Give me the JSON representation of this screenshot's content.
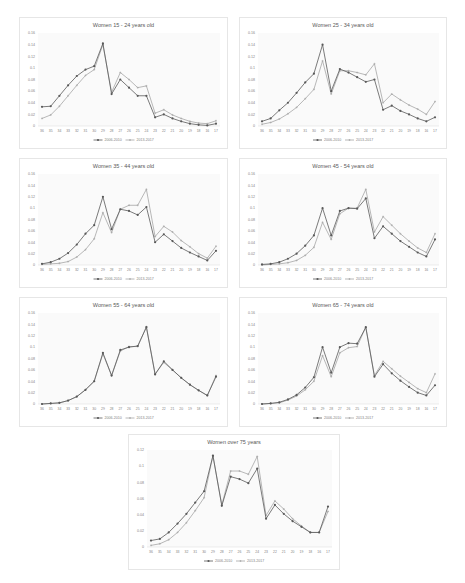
{
  "chart_data": [
    {
      "type": "line",
      "title": "Women 15 - 24 years old",
      "xlabel": "",
      "ylabel": "",
      "ylim": [
        0,
        0.16
      ],
      "yticks": [
        "0",
        "0.02",
        "0.04",
        "0.06",
        "0.08",
        "0.1",
        "0.12",
        "0.14",
        "0.16"
      ],
      "grid": false,
      "legend_position": "bottom",
      "categories": [
        "36",
        "35",
        "34",
        "33",
        "32",
        "31",
        "30",
        "29",
        "28",
        "27",
        "26",
        "25",
        "24",
        "23",
        "22",
        "21",
        "20",
        "19",
        "18",
        "16",
        "17"
      ],
      "series": [
        {
          "name": "2006-2010",
          "values": [
            0.033,
            0.034,
            0.052,
            0.07,
            0.086,
            0.097,
            0.103,
            0.142,
            0.055,
            0.08,
            0.066,
            0.052,
            0.052,
            0.015,
            0.02,
            0.013,
            0.008,
            0.004,
            0.002,
            0.001,
            0.004
          ]
        },
        {
          "name": "2013-2017",
          "values": [
            0.013,
            0.019,
            0.034,
            0.052,
            0.07,
            0.087,
            0.097,
            0.14,
            0.058,
            0.092,
            0.08,
            0.066,
            0.069,
            0.022,
            0.028,
            0.019,
            0.013,
            0.008,
            0.005,
            0.004,
            0.009
          ]
        }
      ]
    },
    {
      "type": "line",
      "title": "Women 25 - 34 years old",
      "xlabel": "",
      "ylabel": "",
      "ylim": [
        0,
        0.16
      ],
      "yticks": [
        "0",
        "0.02",
        "0.04",
        "0.06",
        "0.08",
        "0.1",
        "0.12",
        "0.14",
        "0.16"
      ],
      "grid": false,
      "legend_position": "bottom",
      "categories": [
        "36",
        "35",
        "34",
        "33",
        "32",
        "31",
        "30",
        "29",
        "28",
        "27",
        "26",
        "25",
        "24",
        "23",
        "22",
        "21",
        "20",
        "19",
        "18",
        "16",
        "17"
      ],
      "series": [
        {
          "name": "2006-2010",
          "values": [
            0.008,
            0.013,
            0.027,
            0.04,
            0.057,
            0.075,
            0.09,
            0.14,
            0.06,
            0.098,
            0.092,
            0.084,
            0.076,
            0.08,
            0.028,
            0.035,
            0.026,
            0.02,
            0.013,
            0.008,
            0.015
          ]
        },
        {
          "name": "2013-2017",
          "values": [
            0.003,
            0.006,
            0.012,
            0.021,
            0.032,
            0.047,
            0.063,
            0.112,
            0.055,
            0.095,
            0.095,
            0.092,
            0.088,
            0.107,
            0.04,
            0.055,
            0.045,
            0.036,
            0.029,
            0.02,
            0.042
          ]
        }
      ]
    },
    {
      "type": "line",
      "title": "Women 35 - 44 years old",
      "xlabel": "",
      "ylabel": "",
      "ylim": [
        0,
        0.16
      ],
      "yticks": [
        "0",
        "0.02",
        "0.04",
        "0.06",
        "0.08",
        "0.1",
        "0.12",
        "0.14",
        "0.16"
      ],
      "grid": false,
      "legend_position": "bottom",
      "categories": [
        "36",
        "35",
        "34",
        "33",
        "32",
        "31",
        "30",
        "29",
        "28",
        "27",
        "26",
        "25",
        "24",
        "23",
        "22",
        "21",
        "20",
        "19",
        "18",
        "16",
        "17"
      ],
      "series": [
        {
          "name": "2006-2010",
          "values": [
            0.002,
            0.005,
            0.011,
            0.021,
            0.036,
            0.055,
            0.07,
            0.12,
            0.063,
            0.098,
            0.095,
            0.088,
            0.102,
            0.04,
            0.054,
            0.042,
            0.03,
            0.022,
            0.015,
            0.008,
            0.025
          ]
        },
        {
          "name": "2013-2017",
          "values": [
            0.001,
            0.002,
            0.003,
            0.006,
            0.014,
            0.027,
            0.046,
            0.092,
            0.057,
            0.098,
            0.105,
            0.105,
            0.133,
            0.05,
            0.068,
            0.058,
            0.043,
            0.032,
            0.02,
            0.012,
            0.033
          ]
        }
      ]
    },
    {
      "type": "line",
      "title": "Women 45 - 54 years old",
      "xlabel": "",
      "ylabel": "",
      "ylim": [
        0,
        0.16
      ],
      "yticks": [
        "0",
        "0.02",
        "0.04",
        "0.06",
        "0.08",
        "0.1",
        "0.12",
        "0.14",
        "0.16"
      ],
      "grid": false,
      "legend_position": "bottom",
      "categories": [
        "36",
        "35",
        "34",
        "33",
        "32",
        "31",
        "30",
        "29",
        "28",
        "27",
        "26",
        "25",
        "24",
        "23",
        "22",
        "21",
        "20",
        "19",
        "18",
        "16",
        "17"
      ],
      "series": [
        {
          "name": "2006-2010",
          "values": [
            0.001,
            0.002,
            0.005,
            0.011,
            0.02,
            0.034,
            0.052,
            0.1,
            0.052,
            0.095,
            0.1,
            0.099,
            0.117,
            0.047,
            0.068,
            0.055,
            0.042,
            0.032,
            0.022,
            0.015,
            0.045
          ]
        },
        {
          "name": "2013-2017",
          "values": [
            0.0,
            0.001,
            0.002,
            0.004,
            0.008,
            0.017,
            0.031,
            0.075,
            0.045,
            0.09,
            0.1,
            0.1,
            0.133,
            0.058,
            0.085,
            0.07,
            0.055,
            0.042,
            0.03,
            0.022,
            0.055
          ]
        }
      ]
    },
    {
      "type": "line",
      "title": "Women 55 - 64 years old",
      "xlabel": "",
      "ylabel": "",
      "ylim": [
        0,
        0.16
      ],
      "yticks": [
        "0",
        "0.02",
        "0.04",
        "0.06",
        "0.08",
        "0.1",
        "0.12",
        "0.14",
        "0.16"
      ],
      "grid": false,
      "legend_position": "bottom",
      "categories": [
        "36",
        "35",
        "34",
        "33",
        "32",
        "31",
        "30",
        "29",
        "28",
        "27",
        "26",
        "25",
        "24",
        "23",
        "22",
        "21",
        "20",
        "19",
        "18",
        "16",
        "17"
      ],
      "series": [
        {
          "name": "2006-2010",
          "values": [
            0.0,
            0.001,
            0.002,
            0.006,
            0.013,
            0.025,
            0.04,
            0.09,
            0.05,
            0.095,
            0.1,
            0.102,
            0.135,
            0.052,
            0.075,
            0.06,
            0.046,
            0.034,
            0.024,
            0.015,
            0.048
          ]
        },
        {
          "name": "2013-2017",
          "values": [
            0.0,
            0.001,
            0.002,
            0.006,
            0.013,
            0.025,
            0.04,
            0.088,
            0.05,
            0.093,
            0.101,
            0.101,
            0.136,
            0.053,
            0.073,
            0.06,
            0.046,
            0.034,
            0.024,
            0.015,
            0.05
          ]
        }
      ]
    },
    {
      "type": "line",
      "title": "Women 65 - 74 years old",
      "xlabel": "",
      "ylabel": "",
      "ylim": [
        0,
        0.16
      ],
      "yticks": [
        "0",
        "0.02",
        "0.04",
        "0.06",
        "0.08",
        "0.1",
        "0.12",
        "0.14",
        "0.16"
      ],
      "grid": false,
      "legend_position": "bottom",
      "categories": [
        "36",
        "35",
        "34",
        "33",
        "32",
        "31",
        "30",
        "29",
        "28",
        "27",
        "26",
        "25",
        "24",
        "23",
        "22",
        "21",
        "20",
        "19",
        "18",
        "16",
        "17"
      ],
      "series": [
        {
          "name": "2006-2010",
          "values": [
            0.0,
            0.001,
            0.003,
            0.008,
            0.016,
            0.029,
            0.047,
            0.1,
            0.055,
            0.1,
            0.107,
            0.106,
            0.135,
            0.048,
            0.07,
            0.054,
            0.041,
            0.03,
            0.02,
            0.015,
            0.033
          ]
        },
        {
          "name": "2013-2017",
          "values": [
            0.0,
            0.001,
            0.002,
            0.007,
            0.014,
            0.025,
            0.04,
            0.085,
            0.048,
            0.09,
            0.099,
            0.101,
            0.135,
            0.05,
            0.075,
            0.062,
            0.049,
            0.038,
            0.027,
            0.02,
            0.053
          ]
        }
      ]
    },
    {
      "type": "line",
      "title": "Women over 75 years",
      "xlabel": "",
      "ylabel": "",
      "ylim": [
        0,
        0.12
      ],
      "yticks": [
        "0",
        "0.02",
        "0.04",
        "0.06",
        "0.08",
        "0.1",
        "0.12"
      ],
      "grid": false,
      "legend_position": "bottom",
      "categories": [
        "36",
        "35",
        "34",
        "33",
        "32",
        "31",
        "30",
        "29",
        "28",
        "27",
        "26",
        "25",
        "24",
        "23",
        "22",
        "21",
        "20",
        "19",
        "18",
        "16",
        "17"
      ],
      "series": [
        {
          "name": "2006-2010",
          "values": [
            0.008,
            0.01,
            0.018,
            0.029,
            0.041,
            0.055,
            0.069,
            0.113,
            0.051,
            0.087,
            0.084,
            0.079,
            0.097,
            0.035,
            0.052,
            0.041,
            0.032,
            0.025,
            0.018,
            0.018,
            0.05
          ]
        },
        {
          "name": "2013-2017",
          "values": [
            0.002,
            0.004,
            0.009,
            0.018,
            0.03,
            0.045,
            0.061,
            0.113,
            0.052,
            0.094,
            0.094,
            0.09,
            0.112,
            0.039,
            0.057,
            0.047,
            0.035,
            0.026,
            0.018,
            0.018,
            0.044
          ]
        }
      ]
    }
  ],
  "layout_colors": {
    "series_dark": "#595959",
    "series_light": "#a6a6a6",
    "axis_text": "#7f7f7f"
  }
}
